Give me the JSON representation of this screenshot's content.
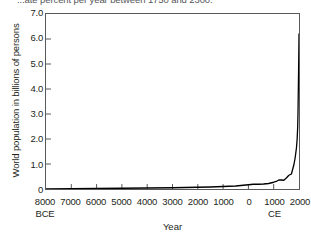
{
  "caption": {
    "text": "...ate percent per year between 1750 and 2300."
  },
  "chart_data": {
    "type": "line",
    "title": "",
    "xlabel": "Year",
    "ylabel": "World population in billions of persons",
    "xlim": [
      -8000,
      2000
    ],
    "ylim": [
      0,
      7.0
    ],
    "grid": false,
    "legend": null,
    "x_tick_labels": [
      "8000",
      "7000",
      "6000",
      "5000",
      "4000",
      "3000",
      "2000",
      "1000",
      "0",
      "1000",
      "2000"
    ],
    "x_tick_values": [
      -8000,
      -7000,
      -6000,
      -5000,
      -4000,
      -3000,
      -2000,
      -1000,
      0,
      1000,
      2000
    ],
    "x_era_labels": [
      {
        "label": "BCE",
        "at": -8000
      },
      {
        "label": "CE",
        "at": 1000
      }
    ],
    "y_tick_labels": [
      "0",
      "1.0",
      "2.0",
      "3.0",
      "4.0",
      "5.0",
      "6.0",
      "7.0"
    ],
    "y_tick_values": [
      0,
      1.0,
      2.0,
      3.0,
      4.0,
      5.0,
      6.0,
      7.0
    ],
    "series": [
      {
        "name": "World population",
        "color": "#000000",
        "x": [
          -8000,
          -7000,
          -6000,
          -5000,
          -4000,
          -3000,
          -2000,
          -1500,
          -1000,
          -500,
          -200,
          0,
          200,
          400,
          600,
          800,
          1000,
          1100,
          1200,
          1300,
          1400,
          1500,
          1600,
          1700,
          1750,
          1800,
          1850,
          1900,
          1927,
          1950,
          1960,
          1974,
          1987,
          1999,
          2000
        ],
        "y": [
          0.005,
          0.01,
          0.02,
          0.03,
          0.04,
          0.05,
          0.07,
          0.08,
          0.1,
          0.12,
          0.15,
          0.17,
          0.19,
          0.19,
          0.2,
          0.22,
          0.27,
          0.3,
          0.36,
          0.36,
          0.35,
          0.44,
          0.55,
          0.6,
          0.79,
          0.98,
          1.26,
          1.65,
          2.0,
          2.52,
          3.02,
          4.0,
          5.0,
          6.0,
          6.2
        ]
      }
    ]
  }
}
